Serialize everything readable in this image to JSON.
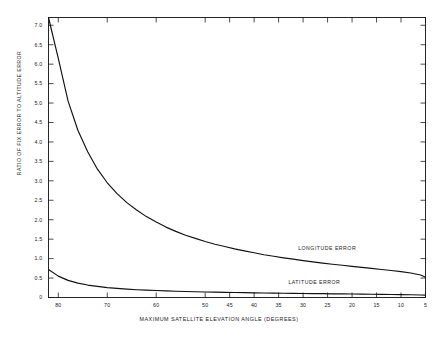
{
  "chart_data": {
    "type": "line",
    "title": "",
    "xlabel": "MAXIMUM SATELLITE ELEVATION ANGLE (DEGREES)",
    "ylabel": "RATIO OF FIX ERROR TO ALTITUDE ERROR",
    "xlim": [
      82,
      5
    ],
    "ylim": [
      0,
      7.2
    ],
    "x_reversed": true,
    "grid": false,
    "legend_position": "inline-annotations",
    "xticks": [
      80,
      70,
      60,
      50,
      45,
      40,
      35,
      30,
      25,
      20,
      15,
      10,
      5
    ],
    "xtick_labels": [
      "80",
      "70",
      "60",
      "50",
      "45",
      "40",
      "35",
      "30",
      "25",
      "20",
      "15",
      "10",
      "5"
    ],
    "yticks": [
      0,
      0.5,
      1.0,
      1.5,
      2.0,
      2.5,
      3.0,
      3.5,
      4.0,
      4.5,
      5.0,
      5.5,
      6.0,
      6.5,
      7.0
    ],
    "ytick_labels": [
      "0",
      "0.5",
      "1.0",
      "1.5",
      "2.0",
      "2.5",
      "3.0",
      "3.5",
      "4.0",
      "4.5",
      "5.0",
      "5.5",
      "6.0",
      "6.5",
      "7.0"
    ],
    "series": [
      {
        "name": "LONGITUDE ERROR",
        "label_x": 31,
        "label_y": 1.25,
        "x": [
          82,
          80,
          78,
          76,
          74,
          72,
          70,
          68,
          66,
          64,
          62,
          60,
          58,
          56,
          54,
          52,
          50,
          48,
          46,
          44,
          42,
          40,
          38,
          36,
          34,
          32,
          30,
          28,
          26,
          24,
          22,
          20,
          18,
          16,
          14,
          12,
          10,
          8,
          6,
          5
        ],
        "values": [
          7.2,
          6.15,
          5.05,
          4.3,
          3.75,
          3.3,
          2.95,
          2.67,
          2.44,
          2.25,
          2.08,
          1.94,
          1.81,
          1.7,
          1.6,
          1.52,
          1.44,
          1.37,
          1.31,
          1.25,
          1.2,
          1.15,
          1.1,
          1.06,
          1.02,
          0.985,
          0.95,
          0.915,
          0.885,
          0.855,
          0.83,
          0.8,
          0.775,
          0.75,
          0.72,
          0.695,
          0.665,
          0.63,
          0.58,
          0.52
        ]
      },
      {
        "name": "LATITUDE ERROR",
        "label_x": 33,
        "label_y": 0.38,
        "x": [
          82,
          80,
          78,
          76,
          74,
          72,
          70,
          68,
          66,
          64,
          62,
          60,
          58,
          56,
          54,
          52,
          50,
          48,
          46,
          44,
          42,
          40,
          38,
          36,
          34,
          32,
          30,
          28,
          26,
          24,
          22,
          20,
          18,
          16,
          14,
          12,
          10,
          8,
          6,
          5
        ],
        "values": [
          0.72,
          0.55,
          0.44,
          0.37,
          0.32,
          0.285,
          0.255,
          0.235,
          0.215,
          0.2,
          0.19,
          0.18,
          0.17,
          0.162,
          0.155,
          0.148,
          0.142,
          0.137,
          0.132,
          0.128,
          0.124,
          0.12,
          0.117,
          0.113,
          0.11,
          0.107,
          0.104,
          0.101,
          0.098,
          0.095,
          0.092,
          0.09,
          0.087,
          0.084,
          0.081,
          0.078,
          0.074,
          0.07,
          0.065,
          0.06
        ]
      }
    ]
  },
  "axis_label_y": "RATIO OF FIX ERROR TO ALTITUDE ERROR",
  "axis_label_x": "MAXIMUM SATELLITE ELEVATION ANGLE (DEGREES)",
  "colors": {
    "curve": "#111111",
    "frame": "#111111",
    "background": "#ffffff"
  }
}
